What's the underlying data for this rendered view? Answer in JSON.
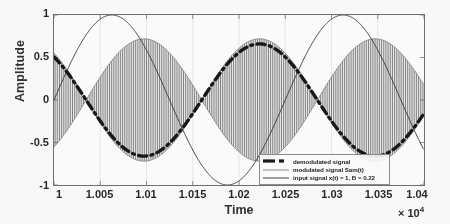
{
  "chart_data": {
    "type": "line",
    "title": "",
    "xlabel": "Time",
    "ylabel": "Amplitude",
    "x_exponent_prefix": "× 10",
    "x_exponent_power": "4",
    "xlim": [
      10000,
      10400
    ],
    "ylim": [
      -1,
      1
    ],
    "grid": true,
    "xticks": [
      {
        "value": 10000,
        "label": "1"
      },
      {
        "value": 10050,
        "label": "1.005"
      },
      {
        "value": 10100,
        "label": "1.01"
      },
      {
        "value": 10150,
        "label": "1.015"
      },
      {
        "value": 10200,
        "label": "1.02"
      },
      {
        "value": 10250,
        "label": "1.025"
      },
      {
        "value": 10300,
        "label": "1.03"
      },
      {
        "value": 10350,
        "label": "1.035"
      },
      {
        "value": 10400,
        "label": "1.04"
      }
    ],
    "yticks": [
      {
        "value": 1,
        "label": "1"
      },
      {
        "value": 0.5,
        "label": "0.5"
      },
      {
        "value": 0,
        "label": "0"
      },
      {
        "value": -0.5,
        "label": "-0.5"
      },
      {
        "value": -1,
        "label": "-1"
      }
    ],
    "legend_position": "lower-right",
    "series": [
      {
        "name": "demodulated signal",
        "style": "thick-dashed",
        "color": "#111111",
        "amplitude": 0.66,
        "offset": 0.0,
        "period": 250,
        "phase_deg": 130,
        "description": "thick black dash-dot envelope; starts near 0.5 at t=10000, min -0.70 near t=10090, max 0.62 near t=10225, min near t=10340"
      },
      {
        "name": "modulated signal Sam(t)",
        "style": "thin-dense-carrier",
        "color": "#555555",
        "carrier_period": 4.0,
        "envelope_amplitude": 0.72,
        "envelope_period": 250,
        "envelope_phase_deg": 130,
        "description": "dense high-frequency carrier filling an envelope that mirrors the demodulated signal"
      },
      {
        "name": "input signal x(t) = 1, B = 0.22",
        "style": "thin-solid",
        "color": "#2a2a2a",
        "amplitude": 1.0,
        "period": 250,
        "phase_deg": 0,
        "description": "thin sine, starts at 0 rising, peak +1 at t=10065, trough -1 at t=10190, peak +1 at t=10315"
      }
    ]
  },
  "legend": {
    "items": [
      {
        "label": "demodulated signal",
        "swatch": "thick-dashed-line-icon"
      },
      {
        "label": "modulated signal Sam(t)",
        "swatch": "thin-gray-line-icon"
      },
      {
        "label": "input signal x(t) = 1, B = 0.22",
        "swatch": "thin-line-icon"
      }
    ]
  }
}
